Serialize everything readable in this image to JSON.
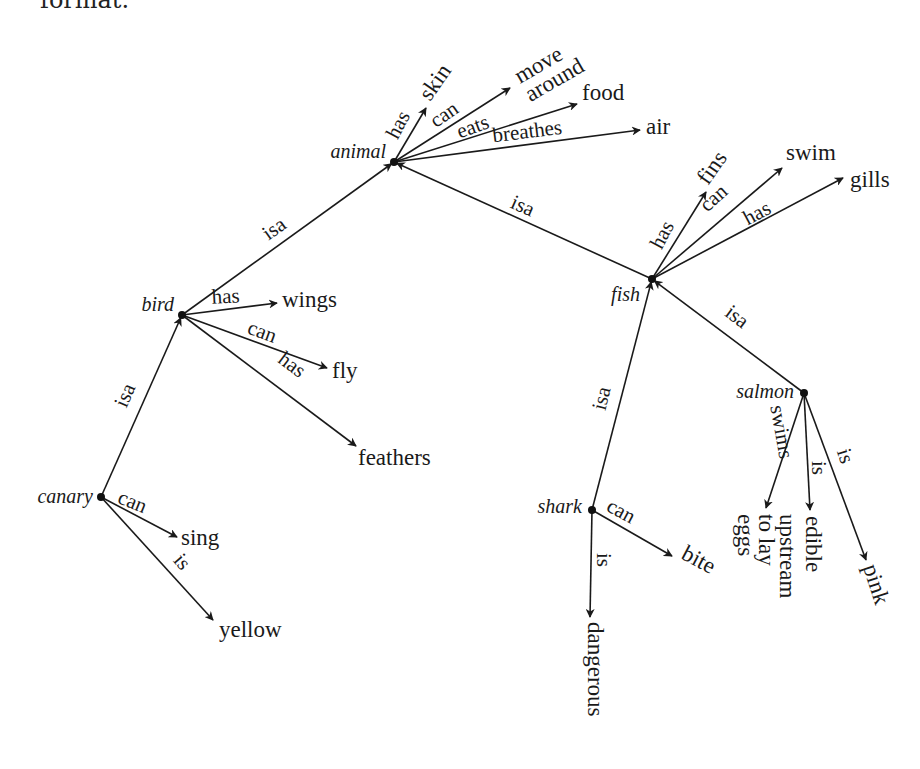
{
  "caption_fragment": "format.",
  "diagram": {
    "type": "semantic-network",
    "nodes": [
      {
        "id": "animal",
        "label": "animal",
        "x": 394,
        "y": 162,
        "label_x": 386,
        "label_y": 158,
        "anchor": "end"
      },
      {
        "id": "bird",
        "label": "bird",
        "x": 182,
        "y": 315,
        "label_x": 174,
        "label_y": 311,
        "anchor": "end"
      },
      {
        "id": "canary",
        "label": "canary",
        "x": 101,
        "y": 497,
        "label_x": 93,
        "label_y": 503,
        "anchor": "end"
      },
      {
        "id": "fish",
        "label": "fish",
        "x": 652,
        "y": 279,
        "label_x": 640,
        "label_y": 301,
        "anchor": "end"
      },
      {
        "id": "salmon",
        "label": "salmon",
        "x": 804,
        "y": 393,
        "label_x": 794,
        "label_y": 398,
        "anchor": "end"
      },
      {
        "id": "shark",
        "label": "shark",
        "x": 592,
        "y": 510,
        "label_x": 582,
        "label_y": 513,
        "anchor": "end"
      }
    ],
    "edges": [
      {
        "from": "bird",
        "to": "animal",
        "relation": "isa",
        "x1": 182,
        "y1": 315,
        "x2": 394,
        "y2": 162,
        "lx": 278,
        "ly": 234,
        "angle": -36
      },
      {
        "from": "fish",
        "to": "animal",
        "relation": "isa",
        "x1": 652,
        "y1": 279,
        "x2": 394,
        "y2": 162,
        "lx": 520,
        "ly": 212,
        "angle": 24
      },
      {
        "from": "canary",
        "to": "bird",
        "relation": "isa",
        "x1": 101,
        "y1": 497,
        "x2": 182,
        "y2": 315,
        "lx": 131,
        "ly": 398,
        "angle": -66
      },
      {
        "from": "shark",
        "to": "fish",
        "relation": "isa",
        "x1": 592,
        "y1": 510,
        "x2": 652,
        "y2": 279,
        "lx": 608,
        "ly": 400,
        "angle": -76
      },
      {
        "from": "salmon",
        "to": "fish",
        "relation": "isa",
        "x1": 804,
        "y1": 393,
        "x2": 652,
        "y2": 279,
        "lx": 733,
        "ly": 322,
        "angle": 37
      }
    ],
    "properties": [
      {
        "node": "animal",
        "relation": "has",
        "target": "skin",
        "x2": 426,
        "y2": 108,
        "lx": 404,
        "ly": 128,
        "langle": -62,
        "tx": 430,
        "ty": 102,
        "tangle": -55,
        "tanchor": "start"
      },
      {
        "node": "animal",
        "relation": "can",
        "target": "move around",
        "target_lines": [
          "move",
          "around"
        ],
        "x2": 510,
        "y2": 88,
        "lx": 448,
        "ly": 120,
        "langle": -35,
        "tx": 520,
        "ty": 84,
        "tangle": -30,
        "tanchor": "start"
      },
      {
        "node": "animal",
        "relation": "eats",
        "target": "food",
        "x2": 577,
        "y2": 104,
        "lx": 475,
        "ly": 133,
        "langle": -20,
        "tx": 582,
        "ty": 100,
        "tangle": 0,
        "tanchor": "start"
      },
      {
        "node": "animal",
        "relation": "breathes",
        "target": "air",
        "x2": 640,
        "y2": 130,
        "lx": 528,
        "ly": 138,
        "langle": -7,
        "tx": 646,
        "ty": 134,
        "tangle": 0,
        "tanchor": "start"
      },
      {
        "node": "bird",
        "relation": "has",
        "target": "wings",
        "x2": 277,
        "y2": 303,
        "lx": 226,
        "ly": 303,
        "langle": -3,
        "tx": 282,
        "ty": 307,
        "tangle": 0,
        "tanchor": "start"
      },
      {
        "node": "bird",
        "relation": "can",
        "target": "fly",
        "x2": 327,
        "y2": 368,
        "lx": 260,
        "ly": 338,
        "langle": 20,
        "tx": 332,
        "ty": 378,
        "tangle": 0,
        "tanchor": "start"
      },
      {
        "node": "bird",
        "relation": "has",
        "target": "feathers",
        "x2": 356,
        "y2": 446,
        "lx": 288,
        "ly": 370,
        "langle": 37,
        "tx": 358,
        "ty": 465,
        "tangle": 0,
        "tanchor": "start"
      },
      {
        "node": "canary",
        "relation": "can",
        "target": "sing",
        "x2": 177,
        "y2": 537,
        "lx": 130,
        "ly": 508,
        "langle": 22,
        "tx": 181,
        "ty": 545,
        "tangle": 0,
        "tanchor": "start"
      },
      {
        "node": "canary",
        "relation": "is",
        "target": "yellow",
        "x2": 213,
        "y2": 620,
        "lx": 177,
        "ly": 566,
        "langle": 50,
        "tx": 219,
        "ty": 637,
        "tangle": 0,
        "tanchor": "start"
      },
      {
        "node": "fish",
        "relation": "has",
        "target": "fins",
        "x2": 706,
        "y2": 192,
        "lx": 668,
        "ly": 238,
        "langle": -62,
        "tx": 708,
        "ty": 186,
        "tangle": -55,
        "tanchor": "start"
      },
      {
        "node": "fish",
        "relation": "can",
        "target": "swim",
        "x2": 782,
        "y2": 168,
        "lx": 718,
        "ly": 203,
        "langle": -42,
        "tx": 786,
        "ty": 160,
        "tangle": 0,
        "tanchor": "start"
      },
      {
        "node": "fish",
        "relation": "has",
        "target": "gills",
        "x2": 843,
        "y2": 178,
        "lx": 760,
        "ly": 219,
        "langle": -28,
        "tx": 850,
        "ty": 187,
        "tangle": 0,
        "tanchor": "start"
      },
      {
        "node": "shark",
        "relation": "can",
        "target": "bite",
        "x2": 672,
        "y2": 556,
        "lx": 618,
        "ly": 517,
        "langle": 28,
        "tx": 680,
        "ty": 558,
        "tangle": 28,
        "tanchor": "start"
      },
      {
        "node": "shark",
        "relation": "is",
        "target": "dangerous",
        "x2": 590,
        "y2": 617,
        "lx": 597,
        "ly": 560,
        "langle": 90,
        "tx": 588,
        "ty": 622,
        "tangle": 90,
        "tanchor": "start"
      },
      {
        "node": "salmon",
        "relation": "swims",
        "target": "upstream to lay eggs",
        "target_lines": [
          "upstream",
          "to lay",
          "eggs"
        ],
        "x2": 766,
        "y2": 508,
        "lx": 775,
        "ly": 433,
        "langle": 80,
        "tx": 780,
        "ty": 514,
        "tangle": 90,
        "tanchor": "start"
      },
      {
        "node": "salmon",
        "relation": "is",
        "target": "edible",
        "x2": 810,
        "y2": 510,
        "lx": 812,
        "ly": 468,
        "langle": 90,
        "tx": 806,
        "ty": 516,
        "tangle": 90,
        "tanchor": "start"
      },
      {
        "node": "salmon",
        "relation": "is",
        "target": "pink",
        "x2": 866,
        "y2": 560,
        "lx": 839,
        "ly": 458,
        "langle": 72,
        "tx": 863,
        "ty": 567,
        "tangle": 72,
        "tanchor": "start"
      }
    ]
  }
}
